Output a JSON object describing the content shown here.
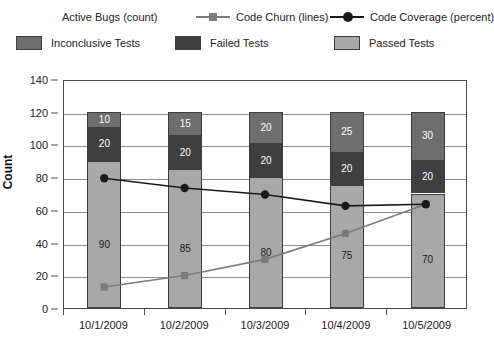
{
  "chart_data": {
    "type": "bar",
    "title": "",
    "subtitle": "",
    "xlabel": "",
    "ylabel": "Count",
    "categories": [
      "10/1/2009",
      "10/2/2009",
      "10/3/2009",
      "10/4/2009",
      "10/5/2009"
    ],
    "ylim": [
      0,
      140
    ],
    "y_ticks": [
      0,
      20,
      40,
      60,
      80,
      100,
      120,
      140
    ],
    "grid": true,
    "stacked": true,
    "legend_position": "top",
    "series": [
      {
        "name": "Passed Tests",
        "kind": "bar",
        "stack_order": 0,
        "color": "#a8a8a8",
        "marker": "square-swatch",
        "values": [
          90,
          85,
          80,
          75,
          70
        ]
      },
      {
        "name": "Failed Tests",
        "kind": "bar",
        "stack_order": 1,
        "color": "#3f3f3f",
        "marker": "square-swatch",
        "values": [
          20,
          20,
          20,
          20,
          20
        ]
      },
      {
        "name": "Inconclusive Tests",
        "kind": "bar",
        "stack_order": 2,
        "color": "#6e6e6e",
        "marker": "square-swatch",
        "values": [
          10,
          15,
          20,
          25,
          30
        ]
      },
      {
        "name": "Active Bugs (count)",
        "kind": "line",
        "color": "#7a7a7a",
        "marker": "none",
        "values": [
          null,
          null,
          null,
          null,
          null
        ]
      },
      {
        "name": "Code Churn (lines)",
        "kind": "line",
        "color": "#7a7a7a",
        "marker": "square",
        "values": [
          13,
          20,
          30,
          46,
          64
        ]
      },
      {
        "name": "Code Coverage (percent)",
        "kind": "line",
        "color": "#1a1a1a",
        "marker": "circle",
        "values": [
          80,
          74,
          70,
          63,
          64
        ]
      }
    ],
    "bar_totals": [
      120,
      120,
      120,
      120,
      120
    ]
  },
  "legend": {
    "row_lines": [
      {
        "label": "Active Bugs (count)",
        "marker": "none",
        "color": "#7a7a7a"
      },
      {
        "label": "Code Churn (lines)",
        "marker": "square",
        "color": "#7a7a7a"
      },
      {
        "label": "Code Coverage (percent)",
        "marker": "circle",
        "color": "#1a1a1a"
      }
    ],
    "row_bars": [
      {
        "label": "Inconclusive Tests",
        "color": "#6e6e6e"
      },
      {
        "label": "Failed Tests",
        "color": "#3f3f3f"
      },
      {
        "label": "Passed Tests",
        "color": "#a8a8a8"
      }
    ]
  },
  "axes": {
    "y_title": "Count",
    "y_tick_labels": [
      "0",
      "20",
      "40",
      "60",
      "80",
      "100",
      "120",
      "140"
    ],
    "x_tick_labels": [
      "10/1/2009",
      "10/2/2009",
      "10/3/2009",
      "10/4/2009",
      "10/5/2009"
    ]
  },
  "colors": {
    "passed": "#a8a8a8",
    "failed": "#3f3f3f",
    "inconclusive": "#6e6e6e",
    "coverage_line": "#1a1a1a",
    "churn_line": "#7a7a7a",
    "grid": "#8c8c8c",
    "frame": "#4a4a4a",
    "background": "#ffffff"
  }
}
